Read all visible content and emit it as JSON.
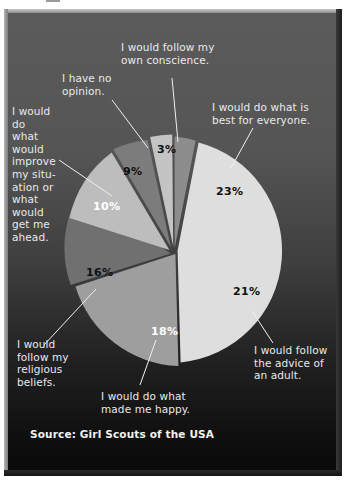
{
  "figure": {
    "clipped_header_fragment": "shows that answers.",
    "source_note": "Source: Girl Scouts of the USA"
  },
  "chart_data": {
    "type": "pie",
    "title": "",
    "subtitle": "",
    "xlabel": "",
    "ylabel": "",
    "legend_position": "callout-labels",
    "grid": false,
    "value_suffix": "%",
    "total": 100,
    "categories": [
      "I would follow my own conscience.",
      "I would do what is best for everyone.",
      "I would follow the advice of an adult.",
      "I would do what made me happy.",
      "I would follow my religious beliefs.",
      "I would do what would improve my situation or what would get me ahead.",
      "I have no opinion."
    ],
    "values": [
      3,
      23,
      21,
      18,
      16,
      10,
      9
    ],
    "slices": [
      {
        "label": "I would follow my own conscience.",
        "value": 3,
        "display": "3%",
        "fill": "#8d8d8d",
        "text_color": "#111111"
      },
      {
        "label": "I would do what is best for everyone.",
        "value": 23,
        "display": "23%",
        "fill": "#dedede",
        "text_color": "#111111"
      },
      {
        "label": "I would follow the advice of an adult.",
        "value": 21,
        "display": "21%",
        "fill": "#9e9e9e",
        "text_color": "#111111"
      },
      {
        "label": "I would do what made me happy.",
        "value": 18,
        "display": "18%",
        "fill": "#6f6f6f",
        "text_color": "#ffffff"
      },
      {
        "label": "I would follow my religious beliefs.",
        "value": 16,
        "display": "16%",
        "fill": "#bdbdbd",
        "text_color": "#111111"
      },
      {
        "label": "I would do what would improve my situation or what would get me ahead.",
        "value": 10,
        "display": "10%",
        "fill": "#7b7b7b",
        "text_color": "#ffffff"
      },
      {
        "label": "I have no opinion.",
        "value": 9,
        "display": "9%",
        "fill": "#c4c4c4",
        "text_color": "#111111"
      }
    ]
  },
  "callouts": {
    "conscience": "I would follow my\nown conscience.",
    "no_opinion": "I have no\nopinion.",
    "best_everyone": "I would do what is\nbest for everyone.",
    "improve_situation": "I would\ndo\nwhat\nwould\nimprove\nmy situ-\nation or\nwhat\nwould\nget me\nahead.",
    "religious": "I would\nfollow my\nreligious\nbeliefs.",
    "happy": "I would do what\nmade me happy.",
    "adult": "I would follow\nthe advice of\nan adult."
  },
  "percent_labels": {
    "p3": "3%",
    "p23": "23%",
    "p21": "21%",
    "p18": "18%",
    "p16": "16%",
    "p10": "10%",
    "p9": "9%"
  }
}
